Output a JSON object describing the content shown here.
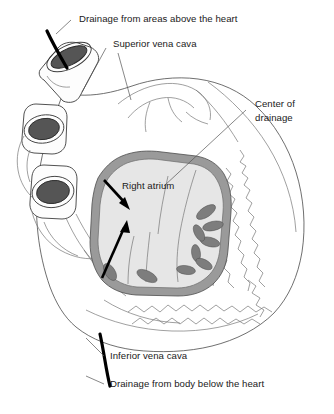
{
  "labels": {
    "drainage_above": "Drainage from areas above the heart",
    "superior_vena_cava": "Superior vena cava",
    "center_of_drainage_line1": "Center of",
    "center_of_drainage_line2": "drainage",
    "right_atrium": "Right atrium",
    "inferior_vena_cava": "Inferior vena cava",
    "drainage_below": "Drainage from body below the heart"
  },
  "structures": {
    "superior_vena_cava_opening": "svc-opening",
    "vessel_opening_middle": "vessel-opening-middle",
    "vessel_opening_lower": "vessel-opening-lower",
    "atrium_wall": "atrium-wall",
    "atrium_cavity": "atrium-cavity",
    "pectinate_muscles": "pectinate-muscles",
    "heart_outline": "heart-outline",
    "inferior_vena_cava_flow": "ivc-flow-line",
    "superior_vena_cava_flow": "svc-flow-line"
  },
  "flow_arrows": [
    {
      "name": "arrow-upper",
      "direction": "down-right"
    },
    {
      "name": "arrow-lower",
      "direction": "up-right"
    }
  ],
  "colors": {
    "background": "#ffffff",
    "outline": "#4a4a4a",
    "atrium_wall": "#9a9a9a",
    "atrium_cavity": "#e6e6e6",
    "lumen": "#555555",
    "pectinate": "#7d7d7d",
    "flow": "#000000",
    "text": "#1a1a1a",
    "leader": "#555555"
  }
}
